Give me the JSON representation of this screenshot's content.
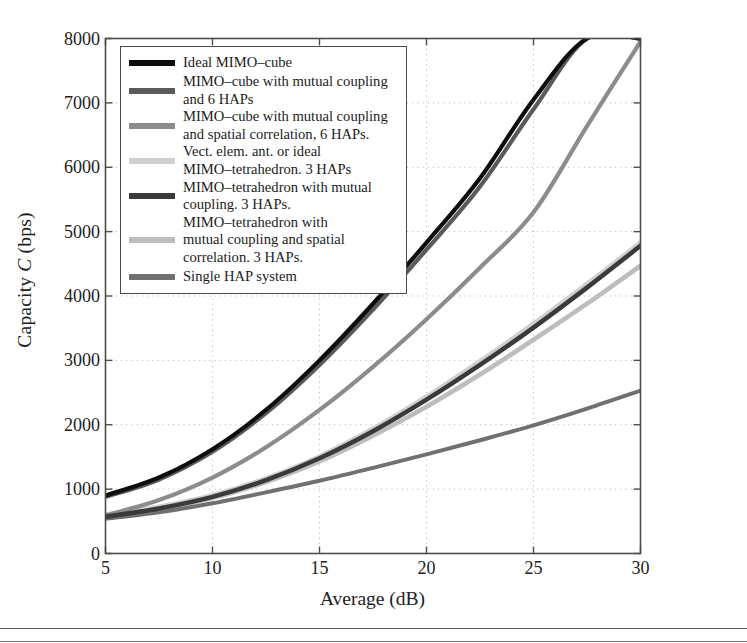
{
  "figure": {
    "background": "#ffffff",
    "axis_color": "#4d4d4d",
    "grid_color": "#b0b0b0"
  },
  "axes": {
    "ylabel_prefix": "Capacity ",
    "ylabel_italic": "C",
    "ylabel_suffix": " (bps)",
    "ylabel_full": "Capacity C (bps)",
    "xlabel": "Average (dB)",
    "xticks": [
      5,
      10,
      15,
      20,
      25,
      30
    ],
    "yticks": [
      0,
      1000,
      2000,
      3000,
      4000,
      5000,
      6000,
      7000,
      8000
    ],
    "xlim": [
      5,
      30
    ],
    "ylim": [
      0,
      8000
    ],
    "grid": true
  },
  "legend": {
    "border_color": "#4a4a4a",
    "entries": [
      {
        "label": "Ideal MIMO–cube",
        "color": "#0d0d0d"
      },
      {
        "label": "MIMO–cube with mutual coupling\nand 6 HAPs",
        "color": "#5a5a5a"
      },
      {
        "label": "MIMO–cube with mutual coupling\nand spatial correlation, 6 HAPs.",
        "color": "#8c8c8c"
      },
      {
        "label": "Vect. elem. ant. or ideal\nMIMO–tetrahedron.  3 HAPs",
        "color": "#cfcfcf"
      },
      {
        "label": "MIMO–tetrahedron with mutual\ncoupling. 3 HAPs.",
        "color": "#3a3a3a"
      },
      {
        "label": "MIMO–tetrahedron with\nmutual coupling and spatial\ncorrelation. 3 HAPs.",
        "color": "#bdbdbd"
      },
      {
        "label": "Single HAP system",
        "color": "#707070"
      }
    ]
  },
  "chart_data": {
    "type": "line",
    "title": "",
    "xlabel": "Average (dB)",
    "ylabel": "Capacity C (bps)",
    "xlim": [
      5,
      30
    ],
    "ylim": [
      0,
      8000
    ],
    "xticks": [
      5,
      10,
      15,
      20,
      25,
      30
    ],
    "yticks": [
      0,
      1000,
      2000,
      3000,
      4000,
      5000,
      6000,
      7000,
      8000
    ],
    "grid": true,
    "legend_position": "upper-left",
    "x": [
      5,
      7.5,
      10,
      12.5,
      15,
      17.5,
      20,
      22.5,
      25,
      27.5,
      30
    ],
    "series": [
      {
        "name": "Ideal MIMO–cube",
        "color": "#0d0d0d",
        "linewidth": 4.2,
        "values": [
          900,
          1180,
          1620,
          2230,
          3000,
          3880,
          4830,
          5830,
          7050,
          8000,
          8000
        ],
        "clipped_at_top_x": 25
      },
      {
        "name": "MIMO–cube with mutual coupling and 6 HAPs",
        "color": "#5a5a5a",
        "linewidth": 4.2,
        "values": [
          880,
          1150,
          1580,
          2180,
          2930,
          3790,
          4720,
          5700,
          6900,
          8000,
          8000
        ],
        "clipped_at_top_x": 27.5
      },
      {
        "name": "MIMO–cube with mutual coupling and spatial correlation, 6 HAPs.",
        "color": "#8c8c8c",
        "linewidth": 4.2,
        "values": [
          590,
          830,
          1180,
          1650,
          2230,
          2900,
          3640,
          4440,
          5300,
          6640,
          7950
        ]
      },
      {
        "name": "Vect. elem. ant. or ideal MIMO–tetrahedron.  3 HAPs",
        "color": "#cfcfcf",
        "linewidth": 5.5,
        "values": [
          600,
          720,
          900,
          1160,
          1500,
          1930,
          2430,
          2980,
          3560,
          4180,
          4820
        ]
      },
      {
        "name": "MIMO–tetrahedron with mutual coupling. 3 HAPs.",
        "color": "#3a3a3a",
        "linewidth": 4.6,
        "values": [
          570,
          700,
          880,
          1140,
          1480,
          1900,
          2390,
          2930,
          3510,
          4130,
          4780
        ]
      },
      {
        "name": "MIMO–tetrahedron with mutual coupling and spatial correlation. 3 HAPs.",
        "color": "#bdbdbd",
        "linewidth": 4.6,
        "values": [
          565,
          690,
          860,
          1110,
          1430,
          1830,
          2280,
          2780,
          3320,
          3880,
          4470
        ]
      },
      {
        "name": "Single HAP system",
        "color": "#707070",
        "linewidth": 4.0,
        "values": [
          540,
          640,
          780,
          950,
          1130,
          1330,
          1540,
          1760,
          1990,
          2250,
          2530
        ]
      }
    ]
  }
}
